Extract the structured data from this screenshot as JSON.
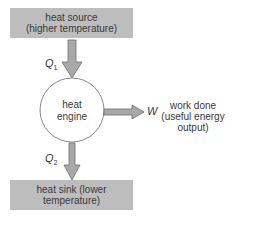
{
  "diagram": {
    "type": "heat-engine-flow",
    "colors": {
      "box_fill": "#bdbdbd",
      "arrow_fill": "#a8a8a8",
      "arrow_stroke": "#6e6e6e",
      "text": "#3a3a3a",
      "circle_stroke": "#8a8a8a"
    },
    "heat_source": {
      "line1": "heat source",
      "line2": "(higher temperature)"
    },
    "q1": {
      "symbol": "Q",
      "subscript": "1"
    },
    "engine": {
      "line1": "heat",
      "line2": "engine"
    },
    "work": {
      "symbol": "W",
      "line1": "work done",
      "line2": "(useful energy",
      "line3": "output)"
    },
    "q2": {
      "symbol": "Q",
      "subscript": "2"
    },
    "heat_sink": {
      "line1": "heat sink (lower",
      "line2": "temperature)"
    }
  }
}
